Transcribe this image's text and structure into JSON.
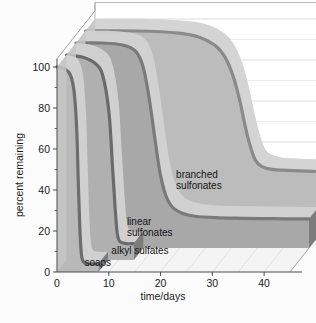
{
  "chart_data": {
    "type": "area",
    "title": "",
    "subtitle": "",
    "xlabel": "time/days",
    "ylabel": "percent remaining",
    "xlim": [
      0,
      45
    ],
    "ylim": [
      0,
      108
    ],
    "xticks": [
      0,
      10,
      20,
      30,
      40
    ],
    "xtick_labels": [
      "0",
      "10",
      "20",
      "30",
      "40"
    ],
    "yticks": [
      0,
      20,
      40,
      60,
      80,
      100
    ],
    "ytick_labels": [
      "0",
      "20",
      "40",
      "60",
      "80",
      "100"
    ],
    "yminorticks": [
      10,
      30,
      50,
      70,
      90
    ],
    "grid": "horizontal-gridlines-on-back-wall",
    "legend": "inline-annotations",
    "projection": "3d-ribbon-depth",
    "series": [
      {
        "name": "soaps",
        "label": "soaps",
        "depth_index": 0,
        "fill": "#b9b9b9",
        "line": "#6d6d6d",
        "points": [
          {
            "x": 0,
            "y": 100
          },
          {
            "x": 1.6,
            "y": 99
          },
          {
            "x": 2.6,
            "y": 96
          },
          {
            "x": 3.3,
            "y": 88
          },
          {
            "x": 3.8,
            "y": 70
          },
          {
            "x": 4.1,
            "y": 45
          },
          {
            "x": 4.4,
            "y": 22
          },
          {
            "x": 4.7,
            "y": 9
          },
          {
            "x": 5.1,
            "y": 5
          },
          {
            "x": 6.0,
            "y": 4
          },
          {
            "x": 8.0,
            "y": 4
          }
        ]
      },
      {
        "name": "alkyl sulfates",
        "label": "alkyl sulfates",
        "depth_index": 1,
        "fill": "#b0b0b0",
        "line": "#6a6a6a",
        "points": [
          {
            "x": 0,
            "y": 100
          },
          {
            "x": 3.0,
            "y": 99
          },
          {
            "x": 5.5,
            "y": 96
          },
          {
            "x": 7.0,
            "y": 90
          },
          {
            "x": 8.2,
            "y": 72
          },
          {
            "x": 8.9,
            "y": 45
          },
          {
            "x": 9.4,
            "y": 25
          },
          {
            "x": 9.8,
            "y": 13
          },
          {
            "x": 10.3,
            "y": 9
          },
          {
            "x": 11.5,
            "y": 8
          },
          {
            "x": 13.0,
            "y": 8
          }
        ]
      },
      {
        "name": "linear sulfonates",
        "label": "linear sulfonates",
        "depth_index": 2,
        "fill": "#a8a8a8",
        "line": "#7a7a7a",
        "points": [
          {
            "x": 0,
            "y": 100
          },
          {
            "x": 5,
            "y": 100
          },
          {
            "x": 9,
            "y": 99
          },
          {
            "x": 11.5,
            "y": 96
          },
          {
            "x": 13.0,
            "y": 88
          },
          {
            "x": 14.2,
            "y": 72
          },
          {
            "x": 15.2,
            "y": 54
          },
          {
            "x": 16.2,
            "y": 37
          },
          {
            "x": 17.3,
            "y": 26
          },
          {
            "x": 18.6,
            "y": 20
          },
          {
            "x": 20.5,
            "y": 17
          },
          {
            "x": 23,
            "y": 15.5
          },
          {
            "x": 27,
            "y": 14.8
          },
          {
            "x": 32,
            "y": 14.5
          },
          {
            "x": 38,
            "y": 14.3
          },
          {
            "x": 44,
            "y": 14.2
          }
        ]
      },
      {
        "name": "branched sulfonates",
        "label": "branched sulfonates",
        "depth_index": 3,
        "fill": "#bcbcbc",
        "line": "#8a8a8a",
        "points": [
          {
            "x": 0,
            "y": 100
          },
          {
            "x": 10,
            "y": 100
          },
          {
            "x": 18,
            "y": 99
          },
          {
            "x": 22,
            "y": 97
          },
          {
            "x": 25,
            "y": 93
          },
          {
            "x": 27,
            "y": 87
          },
          {
            "x": 28.5,
            "y": 78
          },
          {
            "x": 29.8,
            "y": 66
          },
          {
            "x": 30.8,
            "y": 54
          },
          {
            "x": 31.8,
            "y": 44
          },
          {
            "x": 32.8,
            "y": 37
          },
          {
            "x": 34,
            "y": 34
          },
          {
            "x": 36,
            "y": 32.5
          },
          {
            "x": 39,
            "y": 32
          },
          {
            "x": 44,
            "y": 31.5
          }
        ]
      }
    ],
    "annotations": [
      {
        "text": "branched sulfonates",
        "line1": "branched",
        "line2": "sulfonates",
        "x": 23,
        "y": 46
      },
      {
        "text": "linear sulfonates",
        "line1": "linear",
        "line2": "sulfonates",
        "x": 13.5,
        "y": 23
      },
      {
        "text": "alkyl sulfates",
        "line1": "alkyl sulfates",
        "line2": "",
        "x": 10.5,
        "y": 9
      },
      {
        "text": "soaps",
        "line1": "soaps",
        "line2": "",
        "x": 5.3,
        "y": 3
      }
    ]
  },
  "colors": {
    "background": "#fcfcfc",
    "axis": "#4a4a4a",
    "gridline": "#c9c9c9",
    "back_wall": "#ffffff",
    "floor": "#f2f2f2",
    "text": "#1a1a1a"
  }
}
